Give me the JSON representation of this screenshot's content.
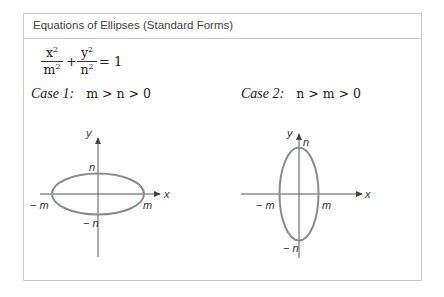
{
  "title": "Equations of Ellipses (Standard Forms)",
  "equation": {
    "term1_num": "x",
    "term1_den": "m",
    "term2_num": "y",
    "term2_den": "n",
    "exponent": "2",
    "plus": "+",
    "equals": "= 1"
  },
  "cases": [
    {
      "label": "Case 1:",
      "condition": "m > n > 0",
      "axes": {
        "x": "x",
        "y": "y"
      },
      "points": {
        "x_pos": "m",
        "x_neg": "− m",
        "y_pos": "n",
        "y_neg": "− n"
      },
      "ellipse": {
        "semi_x_ratio": 1.0,
        "semi_y_ratio": 0.45
      }
    },
    {
      "label": "Case 2:",
      "condition": "n > m > 0",
      "axes": {
        "x": "x",
        "y": "y"
      },
      "points": {
        "x_pos": "m",
        "x_neg": "− m",
        "y_pos": "n",
        "y_neg": "− n"
      },
      "ellipse": {
        "semi_x_ratio": 0.42,
        "semi_y_ratio": 1.0
      }
    }
  ],
  "colors": {
    "ellipse_stroke": "#8a8a8a",
    "axis_stroke": "#555555",
    "border": "#c8c8c8"
  }
}
